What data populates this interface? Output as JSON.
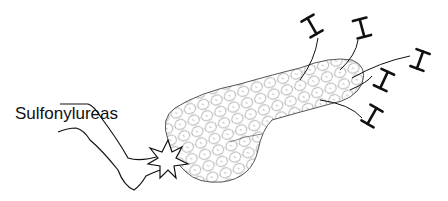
{
  "diagram": {
    "label": "Sulfonylureas",
    "colors": {
      "background": "#ffffff",
      "ink": "#111111",
      "pancreas_outline": "#555555",
      "cell_lines": "#888888"
    },
    "elements": {
      "leg": "leg kicking pancreas",
      "impact": "star burst at point of contact",
      "organ": "pancreas with lobular texture",
      "secretion_symbols_count": 5
    }
  }
}
